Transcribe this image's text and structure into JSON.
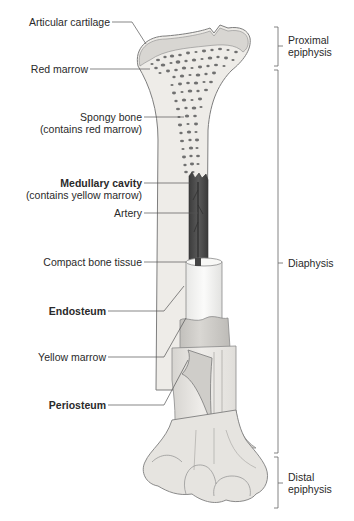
{
  "figure": {
    "colors": {
      "bone_fill": "#eceae6",
      "bone_shade": "#d9d7d3",
      "cartilage": "#dcdad6",
      "outline": "#7a7a7a",
      "marrow_pores": "#6e6e6e",
      "medullary_cavity": "#4a4a4a",
      "compact_bone": "#f5f5f3",
      "periosteum": "#c9c7c3",
      "leader_line": "#555555",
      "bracket": "#666666"
    }
  },
  "left_labels": [
    {
      "id": "articular-cartilage",
      "text": "Articular cartilage",
      "bold": false
    },
    {
      "id": "red-marrow",
      "text": "Red marrow",
      "bold": false
    },
    {
      "id": "spongy-bone",
      "text": "Spongy bone",
      "sub": "(contains red marrow)",
      "bold": false
    },
    {
      "id": "medullary-cavity",
      "text": "Medullary cavity",
      "sub": "(contains yellow marrow)",
      "bold": true
    },
    {
      "id": "artery",
      "text": "Artery",
      "bold": false
    },
    {
      "id": "compact-bone-tissue",
      "text": "Compact bone tissue",
      "bold": false
    },
    {
      "id": "endosteum",
      "text": "Endosteum",
      "bold": true
    },
    {
      "id": "yellow-marrow",
      "text": "Yellow marrow",
      "bold": false
    },
    {
      "id": "periosteum",
      "text": "Periosteum",
      "bold": true
    }
  ],
  "right_labels": [
    {
      "id": "proximal-epiphysis",
      "line1": "Proximal",
      "line2": "epiphysis"
    },
    {
      "id": "diaphysis",
      "line1": "Diaphysis"
    },
    {
      "id": "distal-epiphysis",
      "line1": "Distal",
      "line2": "epiphysis"
    }
  ]
}
